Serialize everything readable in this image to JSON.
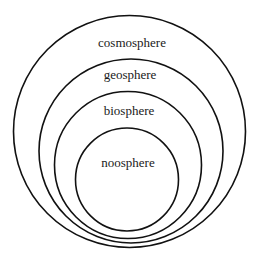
{
  "diagram": {
    "type": "nested-circles",
    "background_color": "#ffffff",
    "stroke_color": "#111111",
    "text_color": "#1a1a1a",
    "spheres": [
      {
        "id": "cosmosphere",
        "label": "cosmosphere",
        "circle": {
          "cx": 129.5,
          "cy": 131.5,
          "r": 116
        },
        "label_pos": {
          "x": 132,
          "y": 47
        }
      },
      {
        "id": "geosphere",
        "label": "geosphere",
        "circle": {
          "cx": 131,
          "cy": 151,
          "r": 92
        },
        "label_pos": {
          "x": 130,
          "y": 79
        }
      },
      {
        "id": "biosphere",
        "label": "biosphere",
        "circle": {
          "cx": 128,
          "cy": 165,
          "r": 73.5
        },
        "label_pos": {
          "x": 129,
          "y": 115
        }
      },
      {
        "id": "noosphere",
        "label": "noosphere",
        "circle": {
          "cx": 127,
          "cy": 179.5,
          "r": 51.5
        },
        "label_pos": {
          "x": 128,
          "y": 167
        }
      }
    ]
  }
}
